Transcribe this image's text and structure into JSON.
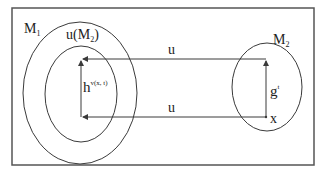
{
  "diagram": {
    "frame": {
      "x": 12,
      "y": 8,
      "w": 302,
      "h": 157
    },
    "stroke_color": "#3a3a3a",
    "sets": {
      "m1": {
        "label": "M",
        "sub": "1"
      },
      "u_m2": {
        "label": "u(M",
        "sub": "2",
        "close": ")"
      },
      "m2": {
        "label": "M",
        "sub": "2"
      }
    },
    "arrows": {
      "top_label": "u",
      "bottom_label": "u",
      "left_label": "h",
      "left_sup": "v(x, t)",
      "right_label": "g",
      "right_sup": "t"
    },
    "point_label": "x"
  }
}
